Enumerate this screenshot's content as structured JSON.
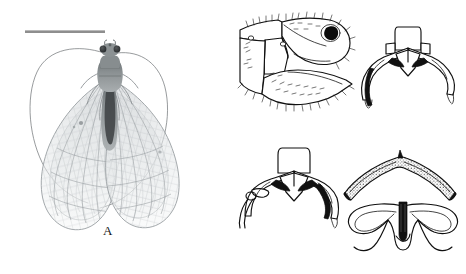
{
  "figure": {
    "kind": "scientific-plate",
    "background_color": "#ffffff",
    "line_color": "#101010",
    "panel_count": 6
  },
  "panels": [
    {
      "id": "A",
      "label": "A",
      "type": "photograph",
      "subject": "lacewing-habitus-dorsal",
      "has_scale_bar": true
    },
    {
      "id": "B",
      "label": "B",
      "type": "line-drawing",
      "subject": "terminalia-lateral-view"
    },
    {
      "id": "C",
      "label": "C",
      "type": "line-drawing",
      "subject": "gonarcus-mediuncus-posterior-view"
    },
    {
      "id": "D",
      "label": "D",
      "type": "line-drawing",
      "subject": "gonarcus-mediuncus-posterior-view"
    },
    {
      "id": "E",
      "label": "E",
      "type": "line-drawing",
      "subject": "gonarcus-arch-dorsal-view"
    },
    {
      "id": "F",
      "label": "F",
      "type": "line-drawing",
      "subject": "gonosaccus-ventral-view"
    }
  ],
  "scale_bar": {
    "color": "#8e8e8e",
    "length_px": 80
  },
  "specimen": {
    "body_color": "#8a8f92",
    "wing_color": "#c8ccce",
    "eye_color": "#2e3133"
  }
}
